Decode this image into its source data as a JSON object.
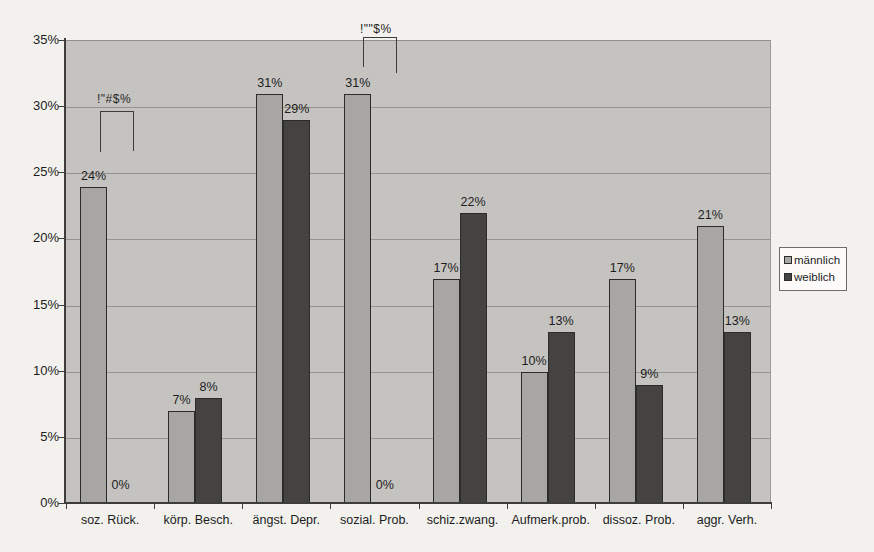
{
  "chart_data": {
    "type": "bar",
    "title": "",
    "xlabel": "",
    "ylabel": "",
    "categories": [
      "soz. Rück.",
      "körp. Besch.",
      "ängst. Depr.",
      "sozial. Prob.",
      "schiz.zwang.",
      "Aufmerk.prob.",
      "dissoz. Prob.",
      "aggr. Verh."
    ],
    "series": [
      {
        "name": "männlich",
        "color": "#a8a6a3",
        "values": [
          24,
          7,
          31,
          31,
          17,
          10,
          17,
          21
        ]
      },
      {
        "name": "weiblich",
        "color": "#454341",
        "values": [
          0,
          8,
          29,
          0,
          22,
          13,
          9,
          13
        ]
      }
    ],
    "value_label_suffix": "%",
    "ylim": [
      0,
      35
    ],
    "ytick_step": 5,
    "ytick_labels": [
      "0%",
      "5%",
      "10%",
      "15%",
      "20%",
      "25%",
      "30%",
      "35%"
    ],
    "grid": true,
    "legend_position": "right",
    "annotations": [
      {
        "text": "!\"#$%",
        "text_x": 97,
        "text_y": 92,
        "lines": [
          [
            100,
            111,
            34,
            1
          ],
          [
            100,
            111,
            1,
            41
          ],
          [
            133,
            111,
            1,
            40
          ]
        ]
      },
      {
        "text": "!\"\"$%",
        "text_x": 360,
        "text_y": 22,
        "lines": [
          [
            363,
            37,
            34,
            1
          ],
          [
            363,
            37,
            1,
            30
          ],
          [
            396,
            37,
            1,
            36
          ]
        ]
      }
    ]
  },
  "colors": {
    "plot_background": "#c5c3c0",
    "page_background": "#f2f1ee",
    "axis": "#3d3d3d",
    "gridline": "#96938e",
    "maennlich_bar": "#a8a6a3",
    "weiblich_bar": "#454341"
  }
}
